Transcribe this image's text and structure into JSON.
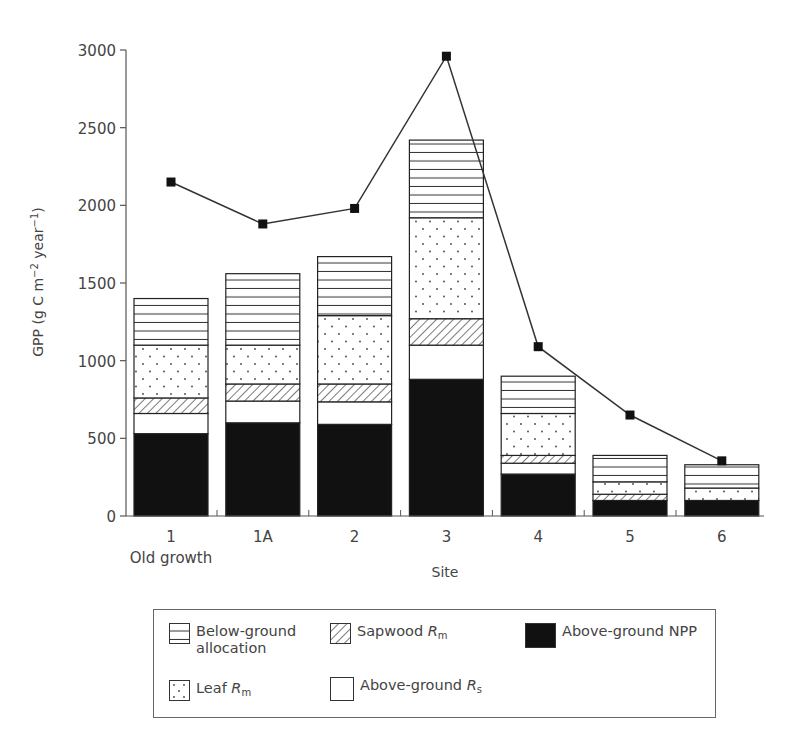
{
  "chart_data": {
    "type": "bar",
    "subtype": "stacked bar with line overlay",
    "title": "",
    "xlabel": "Site",
    "ylabel": "GPP (g C m⁻² year⁻¹)",
    "ylim": [
      0,
      3000
    ],
    "yticks": [
      0,
      500,
      1000,
      1500,
      2000,
      2500,
      3000
    ],
    "categories": [
      "1",
      "1A",
      "2",
      "3",
      "4",
      "5",
      "6"
    ],
    "category_sublabels": {
      "1": "Old growth"
    },
    "grid": false,
    "legend_position": "below",
    "series": [
      {
        "name": "Above-ground NPP",
        "pattern": "solid-black",
        "values": [
          530,
          600,
          590,
          880,
          270,
          100,
          100
        ]
      },
      {
        "name": "Above-ground Rs",
        "pattern": "white",
        "values": [
          130,
          140,
          145,
          220,
          70,
          0,
          0
        ]
      },
      {
        "name": "Sapwood Rm",
        "pattern": "diagonal-hatch",
        "values": [
          100,
          110,
          115,
          170,
          50,
          40,
          0
        ]
      },
      {
        "name": "Leaf Rm",
        "pattern": "dots",
        "values": [
          340,
          250,
          440,
          650,
          270,
          80,
          80
        ]
      },
      {
        "name": "Below-ground allocation",
        "pattern": "horizontal-lines",
        "values": [
          300,
          460,
          380,
          500,
          240,
          170,
          150
        ]
      }
    ],
    "bar_totals": [
      1400,
      1560,
      1670,
      2420,
      900,
      390,
      330
    ],
    "line_series": {
      "name": "GPP",
      "marker": "filled-square",
      "values": [
        2150,
        1880,
        1980,
        2960,
        1090,
        650,
        355
      ]
    }
  },
  "axis": {
    "y_title": "GPP (g C m",
    "y_sup1": "−2",
    "y_mid": " year",
    "y_sup2": "−1",
    "y_end": ")",
    "x_title": "Site",
    "y_tick_labels": [
      "0",
      "500",
      "1000",
      "1500",
      "2000",
      "2500",
      "3000"
    ],
    "x_tick_labels": [
      "1",
      "1A",
      "2",
      "3",
      "4",
      "5",
      "6"
    ],
    "x_sublabel": "Old growth"
  },
  "legend": {
    "below_ground_line1": "Below-ground",
    "below_ground_line2": "allocation",
    "sapwood": "Sapwood ",
    "sapwood_var": "R",
    "sapwood_sub": "m",
    "npp": "Above-ground NPP",
    "leaf": "Leaf ",
    "leaf_var": "R",
    "leaf_sub": "m",
    "rs": "Above-ground ",
    "rs_var": "R",
    "rs_sub": "s"
  },
  "colors": {
    "ink": "#1a1a1a",
    "axis": "#555555",
    "text": "#444444"
  }
}
